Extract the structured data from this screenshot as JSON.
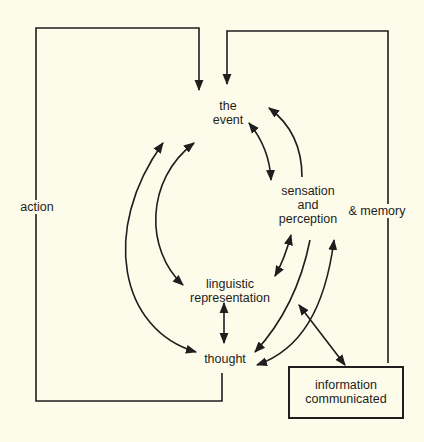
{
  "diagram": {
    "nodes": {
      "event": {
        "line1": "the",
        "line2": "event"
      },
      "sensation": {
        "line1": "sensation",
        "line2": "and",
        "line3": "perception"
      },
      "linguistic": {
        "line1": "linguistic",
        "line2": "representation"
      },
      "thought": {
        "label": "thought"
      },
      "information": {
        "line1": "information",
        "line2": "communicated"
      }
    },
    "edge_labels": {
      "action": "action",
      "memory": "& memory"
    },
    "colors": {
      "background": "#fdfbe9",
      "ink": "#1e1e1e"
    }
  }
}
